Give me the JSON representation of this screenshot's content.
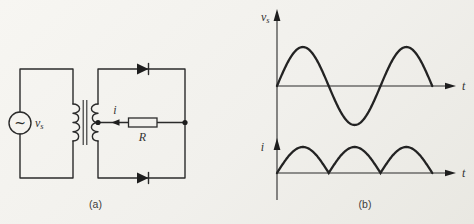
{
  "figure": {
    "line_color": "#2b2b2b",
    "background_color": "#f1f0ec"
  },
  "panel_a": {
    "caption": "(a)",
    "source_symbol": "~",
    "source_label_main": "v",
    "source_label_sub": "s",
    "current_label": "i",
    "resistor_label": "R",
    "components": [
      "ac-voltage-source",
      "center-tapped-transformer",
      "top-diode",
      "bottom-diode",
      "load-resistor-R"
    ]
  },
  "panel_b": {
    "caption": "(b)",
    "top_plot": {
      "y_label_main": "v",
      "y_label_sub": "s",
      "x_label": "t"
    },
    "bottom_plot": {
      "y_label": "i",
      "x_label": "t"
    }
  },
  "chart_data": [
    {
      "type": "line",
      "title": "Source voltage waveform",
      "ylabel": "v_s",
      "xlabel": "t",
      "waveform": "sine",
      "cycles": 1.5,
      "amplitude": 1,
      "axis_labels_numeric": false,
      "grid": false,
      "x": [
        0,
        0.125,
        0.25,
        0.375,
        0.5,
        0.625,
        0.75,
        0.875,
        1.0,
        1.125,
        1.25,
        1.375,
        1.5
      ],
      "y": [
        0,
        0.71,
        1,
        0.71,
        0,
        -0.71,
        -1,
        -0.71,
        0,
        0.71,
        1,
        0.71,
        0
      ]
    },
    {
      "type": "line",
      "title": "Full-wave rectified load current waveform",
      "ylabel": "i",
      "xlabel": "t",
      "waveform": "abs-sine",
      "cycles": 1.5,
      "amplitude": 1,
      "axis_labels_numeric": false,
      "grid": false,
      "x": [
        0,
        0.125,
        0.25,
        0.375,
        0.5,
        0.625,
        0.75,
        0.875,
        1.0,
        1.125,
        1.25,
        1.375,
        1.5
      ],
      "y": [
        0,
        0.71,
        1,
        0.71,
        0,
        0.71,
        1,
        0.71,
        0,
        0.71,
        1,
        0.71,
        0
      ]
    }
  ]
}
